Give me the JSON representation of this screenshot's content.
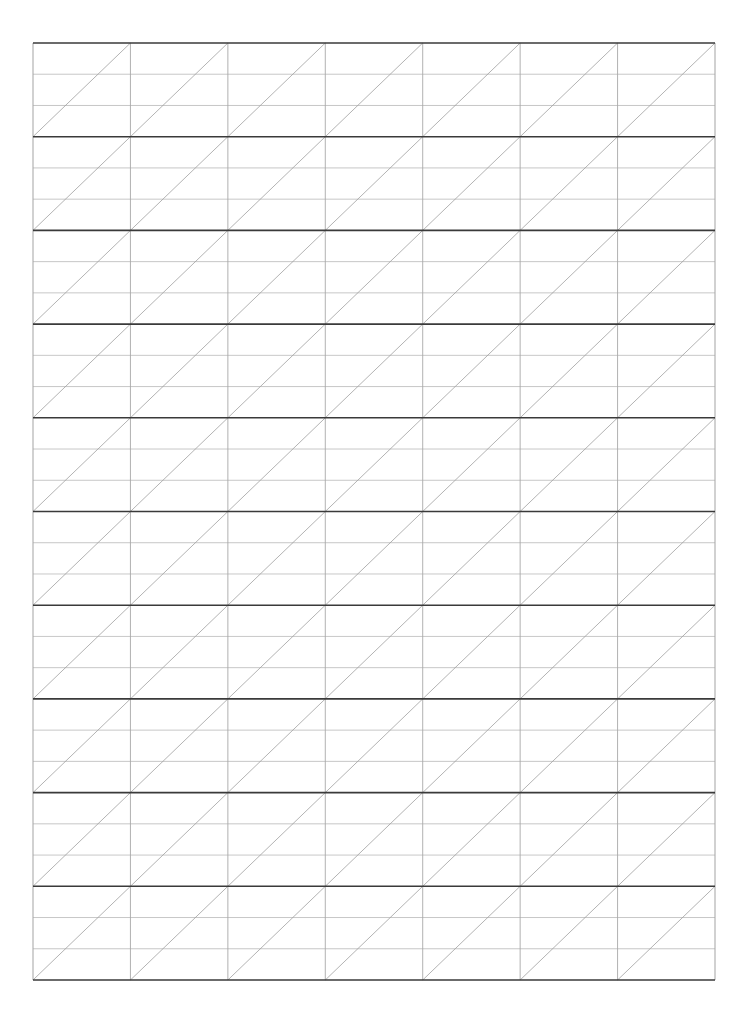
{
  "page": {
    "width": 749,
    "height": 1017,
    "background_color": "#ffffff",
    "paper_type": "scanned-grid-paper"
  },
  "grid": {
    "name": "diagonal-ruled-grid",
    "origin_x": 33,
    "origin_y": 43,
    "right_x": 715,
    "bottom_y": 980,
    "total_width": 682,
    "total_height": 937,
    "columns": 7,
    "column_width": 97.43,
    "major_rows": 10,
    "major_row_height": 93.7,
    "sub_rows_per_major_row": 3,
    "sub_row_height": 31.23,
    "vertical_line_x_positions": [
      33,
      130.4,
      227.9,
      325.3,
      422.7,
      520.1,
      617.6,
      715
    ],
    "major_horizontal_line_y_positions": [
      43,
      136.7,
      230.4,
      324.1,
      417.8,
      511.5,
      605.2,
      698.9,
      792.6,
      886.3,
      980
    ],
    "diagonal_direction": "bottom-left-to-top-right",
    "diagonals_per_cell": 1,
    "total_diagonals": 70
  },
  "styles": {
    "major_line_color": "#3a3a3a",
    "major_line_width": 1.6,
    "minor_line_color": "#b9b9b9",
    "minor_line_width": 0.8,
    "vertical_line_color": "#a8a8a8",
    "vertical_line_width": 0.9,
    "diagonal_line_color": "#a0a0a0",
    "diagonal_line_width": 0.8,
    "border_color": "#3a3a3a"
  },
  "labels": {
    "empty_note": ""
  }
}
